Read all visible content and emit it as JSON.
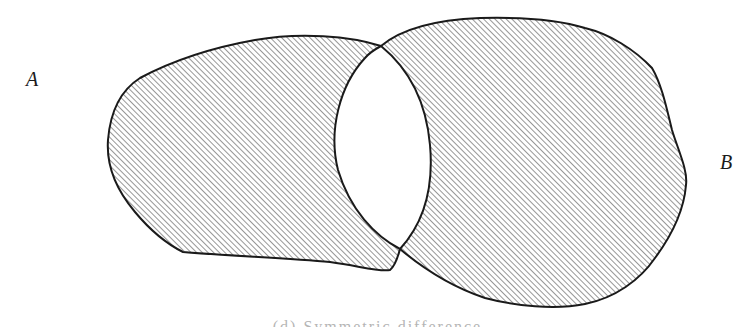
{
  "diagram": {
    "type": "set-diagram",
    "sets": [
      {
        "id": "A",
        "label": "A",
        "position": "left"
      },
      {
        "id": "B",
        "label": "B",
        "position": "right"
      }
    ],
    "shaded_region": "A △ B (symmetric difference)",
    "unshaded_region": "A ∩ B",
    "styles": {
      "outline_color": "#1a1a1a",
      "hatch_color": "#8a8a8a",
      "background": "#ffffff",
      "hatch_direction": "diagonal-up-right"
    }
  },
  "labels": {
    "a": "A",
    "b": "B"
  },
  "caption": {
    "text": "(d) Symmetric difference"
  }
}
